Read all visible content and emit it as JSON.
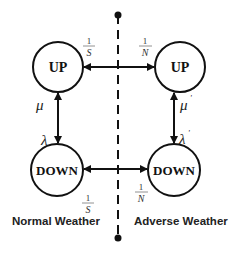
{
  "diagram": {
    "type": "state-transition",
    "divider": {
      "style": "dashed",
      "end_markers": "dots"
    },
    "regions": [
      {
        "id": "normal",
        "caption": "Normal Weather"
      },
      {
        "id": "adverse",
        "caption": "Adverse Weather"
      }
    ],
    "nodes": [
      {
        "id": "up_normal",
        "label": "UP",
        "region": "normal"
      },
      {
        "id": "down_normal",
        "label": "DOWN",
        "region": "normal"
      },
      {
        "id": "up_adverse",
        "label": "UP",
        "region": "adverse"
      },
      {
        "id": "down_adverse",
        "label": "DOWN",
        "region": "adverse"
      }
    ],
    "edges": [
      {
        "from": "up_normal",
        "to": "down_normal",
        "label": "λ",
        "direction": "bidirectional-vertical"
      },
      {
        "from": "down_normal",
        "to": "up_normal",
        "label": "μ"
      },
      {
        "from": "up_adverse",
        "to": "down_adverse",
        "label": "λ'"
      },
      {
        "from": "down_adverse",
        "to": "up_adverse",
        "label": "μ'"
      },
      {
        "from": "up_normal",
        "to": "up_adverse",
        "label_left": "1/S",
        "label_right": "1/N",
        "direction": "bidirectional-horizontal"
      },
      {
        "from": "down_normal",
        "to": "down_adverse",
        "label_left": "1/S",
        "label_right": "1/N",
        "direction": "bidirectional-horizontal"
      }
    ],
    "labels": {
      "up": "UP",
      "down": "DOWN",
      "mu": "μ",
      "mu_prime": "μ",
      "prime": "'",
      "lambda": "λ",
      "lambda_prime": "λ",
      "one": "1",
      "S": "S",
      "N": "N",
      "normal_caption": "Normal Weather",
      "adverse_caption": "Adverse Weather"
    },
    "colors": {
      "stroke": "#111111",
      "background": "#ffffff"
    }
  }
}
